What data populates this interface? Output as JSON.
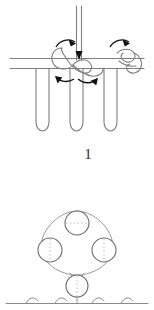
{
  "document": {
    "title": "Beaded edging stitch diagram",
    "background_color": "#ffffff",
    "width": 154,
    "height": 310
  },
  "figure_label": {
    "text": "1",
    "color": "#2b2b2b"
  },
  "colors": {
    "line": "#7f7f7f",
    "line_dark": "#555555",
    "arrow": "#111111",
    "dashed": "#b0b0b0",
    "label": "#2b2b2b"
  },
  "panel_top": {
    "name": "stitch-knot-diagram",
    "description": "Needle thread passing down through a band with three hanging loops and two overhand knots",
    "elements": {
      "needle_thread": {
        "name": "needle-thread-vertical",
        "direction": "down",
        "arrow_label": "downward arrow"
      },
      "band": {
        "name": "fabric-band",
        "line_count": 2,
        "y_positions": [
          58,
          68
        ]
      },
      "loops": {
        "name": "hanging-loops",
        "count": 3,
        "x_positions": [
          42,
          76,
          110
        ],
        "bottom_y": 131
      },
      "knots": {
        "name": "thread-knots",
        "count": 2,
        "x_positions": [
          70,
          121
        ]
      },
      "rotation_arrows": {
        "name": "rotation-arrows",
        "count": 4,
        "meaning": "thread loop direction"
      }
    }
  },
  "panel_bottom": {
    "name": "bead-ring-diagram",
    "description": "Four beads strung in a ring above a single bead resting on the fabric edge",
    "elements": {
      "ring_beads": {
        "name": "ring-beads",
        "count": 3,
        "positions": [
          {
            "cx": 77,
            "cy": 38,
            "r": 12,
            "label": "top-bead"
          },
          {
            "cx": 50,
            "cy": 65,
            "r": 12,
            "label": "left-bead"
          },
          {
            "cx": 104,
            "cy": 65,
            "r": 12,
            "label": "right-bead"
          }
        ]
      },
      "anchor_bead": {
        "name": "anchor-bead",
        "cx": 77,
        "cy": 101,
        "r": 11
      },
      "thread_ring": {
        "name": "thread-ring-path",
        "shape": "closed loop through beads"
      },
      "fabric_edge": {
        "name": "fabric-edge-line",
        "y": 116,
        "stitch_count": 4
      }
    }
  }
}
